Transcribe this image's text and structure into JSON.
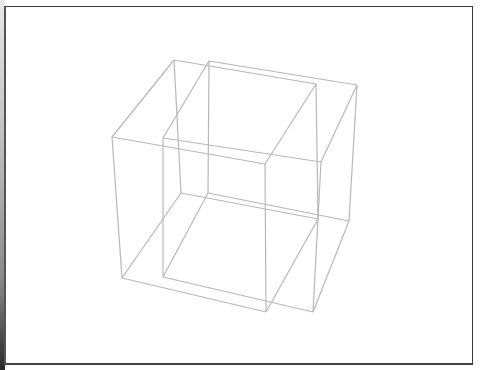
{
  "figure": {
    "line_color": "#b8b8b8",
    "background": "#ffffff",
    "frame_color": "#3a3a3a"
  },
  "cubes": [
    {
      "name": "left-cube",
      "vertices": {
        "back_top_left": [
          174,
          60
        ],
        "back_top_right": [
          316,
          84
        ],
        "front_top_left": [
          112,
          137
        ],
        "front_top_right": [
          265,
          164
        ],
        "back_bottom_left": [
          181,
          193
        ],
        "back_bottom_right": [
          318,
          219
        ],
        "front_bottom_left": [
          122,
          278
        ],
        "front_bottom_right": [
          266,
          312
        ]
      }
    },
    {
      "name": "right-cube",
      "vertices": {
        "back_top_left": [
          209,
          61
        ],
        "back_top_right": [
          357,
          85
        ],
        "front_top_left": [
          163,
          138
        ],
        "front_top_right": [
          321,
          162
        ],
        "back_bottom_left": [
          208,
          193
        ],
        "back_bottom_right": [
          349,
          221
        ],
        "front_bottom_left": [
          163,
          277
        ],
        "front_bottom_right": [
          313,
          312
        ]
      }
    }
  ]
}
